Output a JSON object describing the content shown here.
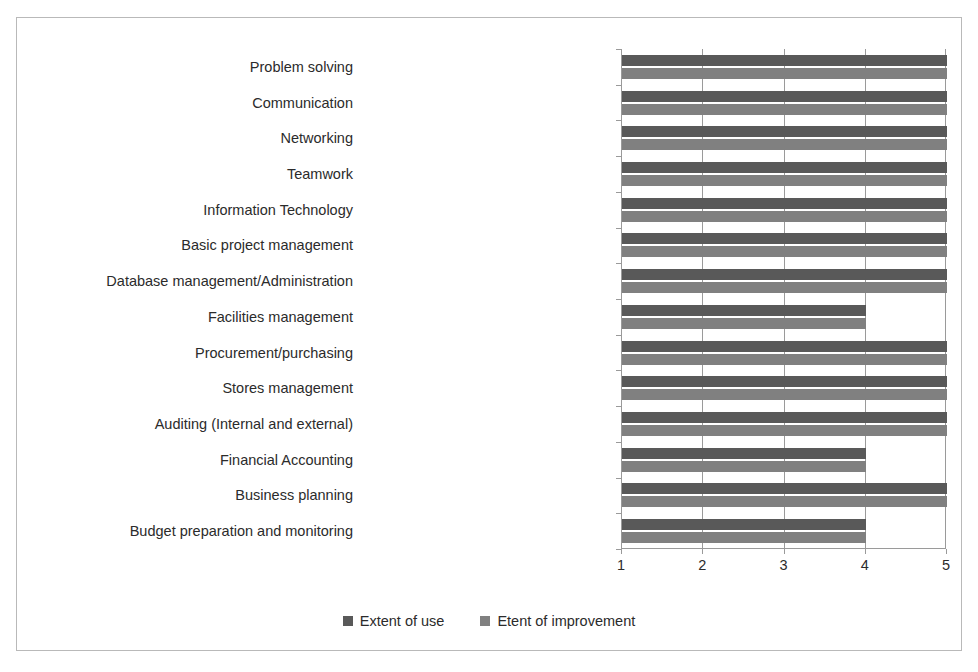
{
  "chart_data": {
    "type": "bar",
    "orientation": "horizontal",
    "title": "",
    "subtitle": "",
    "xlabel": "",
    "ylabel": "",
    "xlim": [
      1,
      5
    ],
    "xticks": [
      "1",
      "2",
      "3",
      "4",
      "5"
    ],
    "grid": true,
    "legend_position": "bottom",
    "categories": [
      "Problem solving",
      "Communication",
      "Networking",
      "Teamwork",
      "Information Technology",
      "Basic project management",
      "Database management/Administration",
      "Facilities management",
      "Procurement/purchasing",
      "Stores management",
      "Auditing (Internal and external)",
      "Financial Accounting",
      "Business planning",
      "Budget preparation and monitoring"
    ],
    "series": [
      {
        "name": "Extent of use",
        "color": "#595959",
        "values": [
          5,
          5,
          5,
          5,
          5,
          5,
          5,
          4,
          5,
          5,
          5,
          4,
          5,
          4
        ]
      },
      {
        "name": "Etent of improvement",
        "color": "#808080",
        "values": [
          5,
          5,
          5,
          5,
          5,
          5,
          5,
          4,
          5,
          5,
          5,
          4,
          5,
          4
        ]
      }
    ]
  },
  "legend": {
    "items": [
      {
        "label": "Extent of use",
        "color": "#595959"
      },
      {
        "label": "Etent of improvement",
        "color": "#808080"
      }
    ]
  },
  "axis": {
    "value_ticks": [
      "1",
      "2",
      "3",
      "4",
      "5"
    ]
  },
  "colors": {
    "series_use": "#595959",
    "series_improvement": "#808080",
    "axis": "#9a9a9a",
    "frame": "#b9b9b9",
    "text": "#2b2b2b",
    "background": "#ffffff"
  }
}
